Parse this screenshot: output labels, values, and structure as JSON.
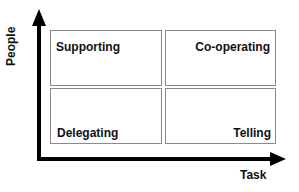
{
  "axes": {
    "y_label": "People",
    "x_label": "Task"
  },
  "quadrants": {
    "top_left": "Supporting",
    "top_right": "Co-operating",
    "bottom_left": "Delegating",
    "bottom_right": "Telling"
  }
}
